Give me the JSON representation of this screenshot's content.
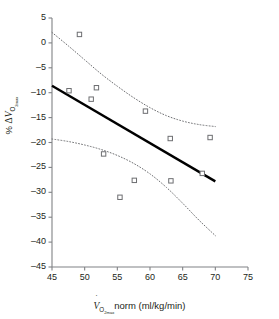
{
  "chart_data": {
    "type": "scatter",
    "title": "",
    "subtitle": "",
    "xlabel": "VO2max norm (ml/kg/min)",
    "ylabel": "% delta VO2max",
    "xlim": [
      45,
      75
    ],
    "ylim": [
      -45,
      5
    ],
    "xticks": [
      45,
      50,
      55,
      60,
      65,
      70,
      75
    ],
    "xtick_labels": [
      "45",
      "50",
      "55",
      "60",
      "65",
      "70",
      "75"
    ],
    "yticks": [
      5,
      0,
      -5,
      -10,
      -15,
      -20,
      -25,
      -30,
      -35,
      -40,
      -45
    ],
    "ytick_labels": [
      "5",
      "0",
      "–5",
      "–10",
      "–15",
      "–20",
      "–25",
      "–30",
      "–35",
      "–40",
      "–45"
    ],
    "grid": false,
    "legend": "none",
    "marker": "open-square",
    "marker_color": "#6d6e71",
    "points": [
      {
        "x": 49.2,
        "y": 1.7
      },
      {
        "x": 47.6,
        "y": -9.6
      },
      {
        "x": 51.0,
        "y": -11.3
      },
      {
        "x": 51.8,
        "y": -9.0
      },
      {
        "x": 52.9,
        "y": -22.3
      },
      {
        "x": 55.4,
        "y": -31.0
      },
      {
        "x": 57.6,
        "y": -27.6
      },
      {
        "x": 59.3,
        "y": -13.7
      },
      {
        "x": 63.1,
        "y": -19.2
      },
      {
        "x": 63.2,
        "y": -27.7
      },
      {
        "x": 68.0,
        "y": -26.2
      },
      {
        "x": 69.2,
        "y": -19.0
      }
    ],
    "series": [
      {
        "name": "regression-line",
        "style": "solid",
        "color": "#000000",
        "x": [
          45.0,
          70.0
        ],
        "values": [
          -8.6,
          -27.8
        ]
      },
      {
        "name": "upper-confidence-band",
        "style": "dotted",
        "color": "#6d6e71",
        "x": [
          45.0,
          47.5,
          50.0,
          52.5,
          55.0,
          57.5,
          60.0,
          62.5,
          65.0,
          67.5,
          70.0
        ],
        "values": [
          2.1,
          -0.6,
          -3.4,
          -6.2,
          -8.7,
          -11.0,
          -13.0,
          -14.6,
          -15.7,
          -16.4,
          -16.8
        ]
      },
      {
        "name": "lower-confidence-band",
        "style": "dotted",
        "color": "#6d6e71",
        "x": [
          45.0,
          47.5,
          50.0,
          52.5,
          55.0,
          57.5,
          60.0,
          62.5,
          65.0,
          67.5,
          70.0
        ],
        "values": [
          -19.3,
          -19.8,
          -20.5,
          -21.4,
          -22.6,
          -24.2,
          -26.3,
          -29.0,
          -32.2,
          -35.6,
          -38.7
        ]
      }
    ],
    "annotations": []
  },
  "axis_titles": {
    "x_prefix": "V",
    "x_sub": "O",
    "x_sub2": "2max",
    "x_rest": "norm (ml/kg/min)",
    "y_percent": "%",
    "y_delta": "Δ",
    "y_v": "V",
    "y_sub": "O",
    "y_sub2": "2max"
  }
}
